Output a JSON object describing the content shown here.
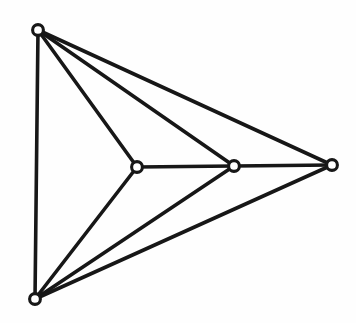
{
  "figure": {
    "kind": "graph-diagram",
    "background_color": "#fefefe",
    "ink_color": "#171717",
    "vertex_fill_color": "#ffffff",
    "width": 356,
    "height": 323
  },
  "graph_data": {
    "type": "node-link-diagram",
    "directed": false,
    "vertex_count": 5,
    "edge_count": 9,
    "vertex_style": {
      "shape": "open-circle",
      "radius": 5.4,
      "stroke_width": 3.1
    },
    "edge_style": {
      "shape": "straight-line",
      "stroke_width": 3.6
    },
    "vertices": [
      {
        "id": "v1",
        "name": "top-left-vertex",
        "x": 38,
        "y": 30,
        "degree": 4
      },
      {
        "id": "v2",
        "name": "bottom-left-vertex",
        "x": 35,
        "y": 299,
        "degree": 4
      },
      {
        "id": "v3",
        "name": "inner-left-vertex",
        "x": 137,
        "y": 167,
        "degree": 3
      },
      {
        "id": "v4",
        "name": "inner-right-vertex",
        "x": 234,
        "y": 166,
        "degree": 4
      },
      {
        "id": "v5",
        "name": "right-vertex",
        "x": 332,
        "y": 165,
        "degree": 3
      }
    ],
    "edges": [
      {
        "id": "e1",
        "name": "edge-top-left-to-bottom-left",
        "source": "v1",
        "target": "v2"
      },
      {
        "id": "e2",
        "name": "edge-top-left-to-inner-left",
        "source": "v1",
        "target": "v3"
      },
      {
        "id": "e3",
        "name": "edge-top-left-to-inner-right",
        "source": "v1",
        "target": "v4"
      },
      {
        "id": "e4",
        "name": "edge-top-left-to-right",
        "source": "v1",
        "target": "v5"
      },
      {
        "id": "e5",
        "name": "edge-bottom-left-to-inner-left",
        "source": "v2",
        "target": "v3"
      },
      {
        "id": "e6",
        "name": "edge-bottom-left-to-inner-right",
        "source": "v2",
        "target": "v4"
      },
      {
        "id": "e7",
        "name": "edge-bottom-left-to-right",
        "source": "v2",
        "target": "v5"
      },
      {
        "id": "e8",
        "name": "edge-inner-left-to-inner-right",
        "source": "v3",
        "target": "v4"
      },
      {
        "id": "e9",
        "name": "edge-inner-right-to-right",
        "source": "v4",
        "target": "v5"
      }
    ]
  }
}
